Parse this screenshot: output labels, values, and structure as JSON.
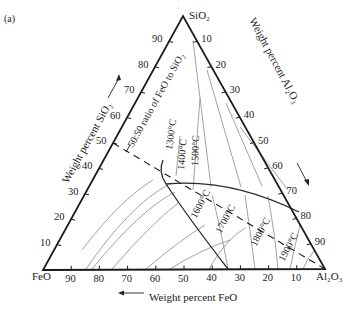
{
  "panel_label": "(a)",
  "vertices": {
    "top": "SiO₂",
    "bottom_left": "FeO",
    "bottom_right": "Al₂O₃"
  },
  "axes": {
    "left_title": "Weight percent SiO₂",
    "right_title": "Weight percent Al₂O₃",
    "bottom_title": "Weight percent FeO",
    "left_ticks": [
      "10",
      "20",
      "30",
      "40",
      "50",
      "60",
      "70",
      "80",
      "90"
    ],
    "right_ticks": [
      "10",
      "20",
      "30",
      "40",
      "50",
      "60",
      "70",
      "80",
      "90"
    ],
    "bottom_ticks": [
      "90",
      "80",
      "70",
      "60",
      "50",
      "40",
      "30",
      "20",
      "10"
    ]
  },
  "ratio_line_label": "50:50 ratio of FeO to SiO₂",
  "isotherms": [
    {
      "label": "1300°C"
    },
    {
      "label": "1400°C"
    },
    {
      "label": "1500°C"
    },
    {
      "label": "1600°C"
    },
    {
      "label": "1700°C"
    },
    {
      "label": "1800°C"
    },
    {
      "label": "1900°C"
    }
  ],
  "colors": {
    "frame": "#1a1a1a",
    "boundary": "#2a2a2a",
    "isotherm": "#8a8a8a",
    "text": "#222222"
  }
}
